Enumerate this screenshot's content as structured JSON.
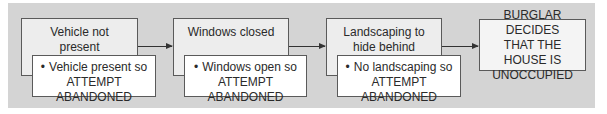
{
  "diagram": {
    "steps": [
      {
        "condition": "Vehicle not present",
        "condition_lines": [
          "Vehicle not",
          "present"
        ],
        "failure": "Vehicle present so",
        "failure_result": "ATTEMPT ABANDONED"
      },
      {
        "condition": "Windows closed",
        "condition_lines": [
          "Windows closed"
        ],
        "failure": "Windows open so",
        "failure_result": "ATTEMPT ABANDONED"
      },
      {
        "condition": "Landscaping to hide behind",
        "condition_lines": [
          "Landscaping to",
          "hide behind"
        ],
        "failure": "No landscaping so",
        "failure_result": "ATTEMPT ABANDONED"
      }
    ],
    "outcome": {
      "lines": [
        "BURGLAR DECIDES",
        "THAT THE HOUSE IS",
        "UNOCCUPIED"
      ]
    },
    "colors": {
      "panel_background": "#d4d4d4",
      "box_background": "#ededed",
      "inner_box_background": "#ffffff",
      "border": "#5a5a5a",
      "text": "#2a2a2a"
    }
  }
}
